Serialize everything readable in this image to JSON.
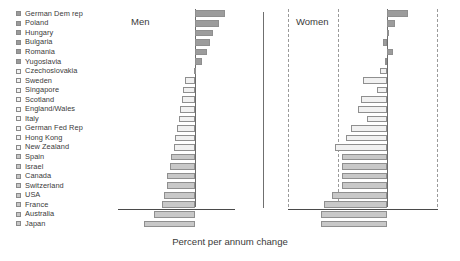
{
  "axis_caption": "Percent per annum change",
  "panels": [
    {
      "key": "men",
      "title": "Men"
    },
    {
      "key": "women",
      "title": "Women"
    }
  ],
  "axis": {
    "min": -10,
    "max": 5,
    "major_ticks": [
      -10,
      -5,
      0,
      5
    ],
    "major_tick_labels": [
      "−10",
      "−5",
      "0",
      "5"
    ],
    "minor_tick_step": 1,
    "grid": "dashed vertical gridlines at -10, -5 and +5 on the Women panel; solid zero line on both panels",
    "legend_position": "left column of country names with shaded swatches"
  },
  "chart_data": {
    "type": "bar",
    "orientation": "horizontal",
    "title": "",
    "subtitle": "",
    "xlabel": "Percent per annum change",
    "ylabel": "",
    "xlim": [
      -10,
      5
    ],
    "categories": [
      "German Dem rep",
      "Poland",
      "Hungary",
      "Bulgaria",
      "Romania",
      "Yugoslavia",
      "Czechoslovakia",
      "Sweden",
      "Singapore",
      "Scotland",
      "England/Wales",
      "Italy",
      "German Fed Rep",
      "Hong Kong",
      "New Zealand",
      "Spain",
      "Israel",
      "Canada",
      "Switzerland",
      "USA",
      "France",
      "Australia",
      "Japan"
    ],
    "group_shades": [
      "dark",
      "dark",
      "dark",
      "dark",
      "dark",
      "dark",
      "pale",
      "pale",
      "pale",
      "pale",
      "pale",
      "pale",
      "pale",
      "pale",
      "pale",
      "mid",
      "mid",
      "mid",
      "mid",
      "mid",
      "mid",
      "mid",
      "mid"
    ],
    "series": [
      {
        "name": "Men",
        "values": [
          3.8,
          3.0,
          2.3,
          1.9,
          1.5,
          0.9,
          -0.2,
          -1.4,
          -1.6,
          -1.7,
          -2.0,
          -2.1,
          -2.4,
          -2.6,
          -2.8,
          -3.2,
          -3.3,
          -3.6,
          -3.7,
          -4.0,
          -4.3,
          -5.4,
          -6.6
        ]
      },
      {
        "name": "Women",
        "values": [
          2.1,
          0.8,
          0.0,
          -0.4,
          0.6,
          -0.2,
          -0.7,
          -2.5,
          -1.0,
          -2.7,
          -3.0,
          -2.0,
          -3.7,
          -4.2,
          -5.3,
          -4.6,
          -4.6,
          -4.6,
          -4.6,
          -5.6,
          -6.4,
          -6.7,
          -6.7
        ]
      }
    ],
    "legend_entries": [
      "Men",
      "Women"
    ]
  }
}
